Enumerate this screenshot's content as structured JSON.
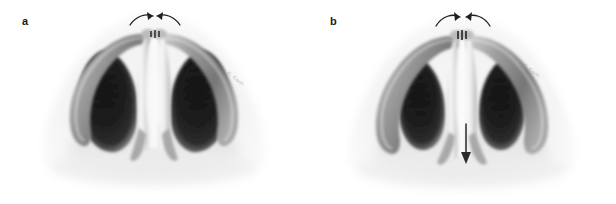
{
  "figure": {
    "caption_present": false,
    "background_color": "#ffffff",
    "ink_color": "#1a1a1a",
    "panel_count": 2
  },
  "panels": [
    {
      "label": "a",
      "signature": "G. Gueli",
      "arrows": [
        {
          "name": "medial-arrow-left",
          "type": "curved",
          "direction": "medial-right"
        },
        {
          "name": "medial-arrow-right",
          "type": "curved",
          "direction": "medial-left"
        }
      ]
    },
    {
      "label": "b",
      "signature": "G. Gueli",
      "arrows": [
        {
          "name": "medial-arrow-left",
          "type": "curved",
          "direction": "medial-right"
        },
        {
          "name": "medial-arrow-right",
          "type": "curved",
          "direction": "medial-left"
        },
        {
          "name": "caudal-arrow",
          "type": "straight",
          "direction": "downward"
        }
      ]
    }
  ],
  "palette": {
    "nostril_dark": "#131313",
    "nostril_mid": "#3d3d3d",
    "cartilage_gray": "#8f8f8f",
    "cartilage_light": "#c9c9c9",
    "skin_hatch": "#e4e4e4",
    "highlight": "#fbfbfb",
    "arrow": "#1f1f1f",
    "signature": "#9a9a9a"
  }
}
